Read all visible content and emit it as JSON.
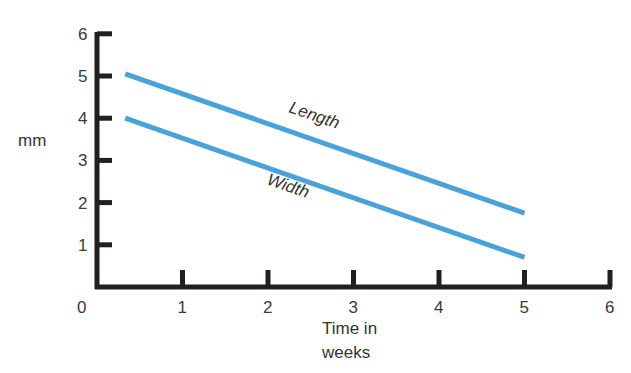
{
  "chart_data": {
    "type": "line",
    "title": "",
    "xlabel": "Time in weeks",
    "xlabel_lines": [
      "Time in",
      "weeks"
    ],
    "ylabel": "mm",
    "xlim": [
      0,
      6
    ],
    "ylim": [
      0,
      6
    ],
    "x_ticks": [
      "0",
      "1",
      "2",
      "3",
      "4",
      "5",
      "6"
    ],
    "y_ticks": [
      "1",
      "2",
      "3",
      "4",
      "5",
      "6"
    ],
    "grid": false,
    "legend": "inline labels on lines",
    "series": [
      {
        "name": "Length",
        "color": "#4aa3d8",
        "x": [
          0.33,
          5
        ],
        "y": [
          5.05,
          1.75
        ]
      },
      {
        "name": "Width",
        "color": "#4aa3d8",
        "x": [
          0.33,
          5
        ],
        "y": [
          4.0,
          0.7
        ]
      }
    ]
  },
  "labels": {
    "ylabel": "mm",
    "xlabel_line1": "Time in",
    "xlabel_line2": "weeks",
    "origin": "0",
    "length": "Length",
    "width": "Width"
  },
  "colors": {
    "axis": "#231f20",
    "line": "#4aa3d8"
  }
}
